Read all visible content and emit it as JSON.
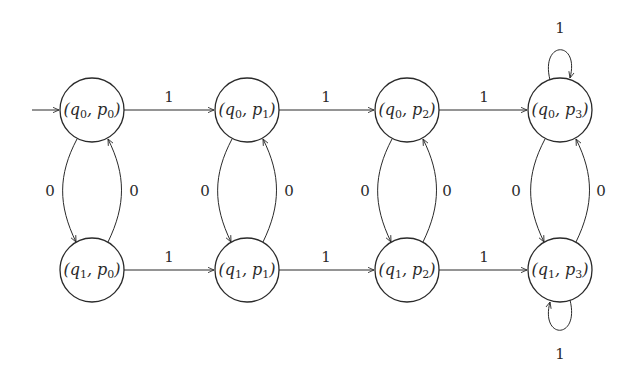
{
  "diagram": {
    "type": "automaton",
    "start_state": "s00",
    "states": [
      {
        "id": "s00",
        "q": "q",
        "qi": "0",
        "p": "p",
        "pi": "0",
        "label": "(q0, p0)"
      },
      {
        "id": "s01",
        "q": "q",
        "qi": "0",
        "p": "p",
        "pi": "1",
        "label": "(q0, p1)"
      },
      {
        "id": "s02",
        "q": "q",
        "qi": "0",
        "p": "p",
        "pi": "2",
        "label": "(q0, p2)"
      },
      {
        "id": "s03",
        "q": "q",
        "qi": "0",
        "p": "p",
        "pi": "3",
        "label": "(q0, p3)"
      },
      {
        "id": "s10",
        "q": "q",
        "qi": "1",
        "p": "p",
        "pi": "0",
        "label": "(q1, p0)"
      },
      {
        "id": "s11",
        "q": "q",
        "qi": "1",
        "p": "p",
        "pi": "1",
        "label": "(q1, p1)"
      },
      {
        "id": "s12",
        "q": "q",
        "qi": "1",
        "p": "p",
        "pi": "2",
        "label": "(q1, p2)"
      },
      {
        "id": "s13",
        "q": "q",
        "qi": "1",
        "p": "p",
        "pi": "3",
        "label": "(q1, p3)"
      }
    ],
    "transitions": [
      {
        "from": "s00",
        "to": "s01",
        "label": "1"
      },
      {
        "from": "s01",
        "to": "s02",
        "label": "1"
      },
      {
        "from": "s02",
        "to": "s03",
        "label": "1"
      },
      {
        "from": "s10",
        "to": "s11",
        "label": "1"
      },
      {
        "from": "s11",
        "to": "s12",
        "label": "1"
      },
      {
        "from": "s12",
        "to": "s13",
        "label": "1"
      },
      {
        "from": "s00",
        "to": "s10",
        "label": "0"
      },
      {
        "from": "s10",
        "to": "s00",
        "label": "0"
      },
      {
        "from": "s01",
        "to": "s11",
        "label": "0"
      },
      {
        "from": "s11",
        "to": "s01",
        "label": "0"
      },
      {
        "from": "s02",
        "to": "s12",
        "label": "0"
      },
      {
        "from": "s12",
        "to": "s02",
        "label": "0"
      },
      {
        "from": "s03",
        "to": "s13",
        "label": "0"
      },
      {
        "from": "s13",
        "to": "s03",
        "label": "0"
      },
      {
        "from": "s03",
        "to": "s03",
        "label": "1"
      },
      {
        "from": "s13",
        "to": "s13",
        "label": "1"
      }
    ]
  }
}
